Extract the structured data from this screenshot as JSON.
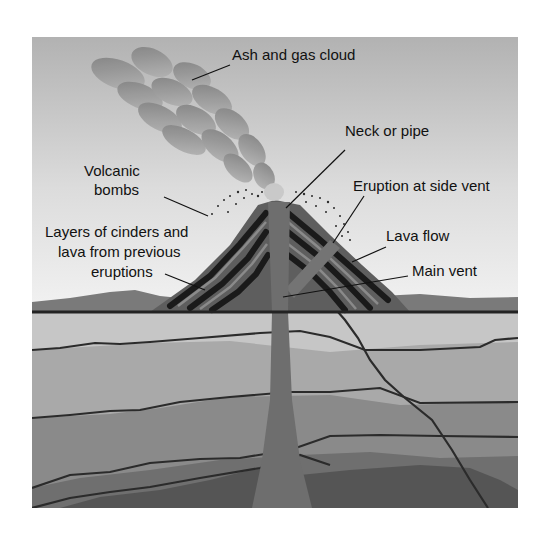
{
  "diagram": {
    "labels": {
      "ash_cloud": "Ash and gas cloud",
      "neck": "Neck or pipe",
      "bombs_line1": "Volcanic",
      "bombs_line2": "bombs",
      "side_vent": "Eruption at side vent",
      "layers_line1": "Layers of cinders and",
      "layers_line2": "lava from previous",
      "layers_line3": "eruptions",
      "lava_flow": "Lava flow",
      "main_vent": "Main vent"
    },
    "colors": {
      "sky_top": "#b4b4b4",
      "sky_bottom": "#ececec",
      "cloud": "#8f8f8f",
      "cone": "#5c5c5c",
      "lava_band": "#1c1c1c",
      "pipe": "#6e6e6e",
      "ground_line": "#2a2a2a",
      "stratum_1": "#c4c4c4",
      "stratum_2": "#a8a8a8",
      "stratum_3": "#8e8e8e",
      "stratum_4": "#767676",
      "stratum_5": "#5a5a5a"
    }
  }
}
